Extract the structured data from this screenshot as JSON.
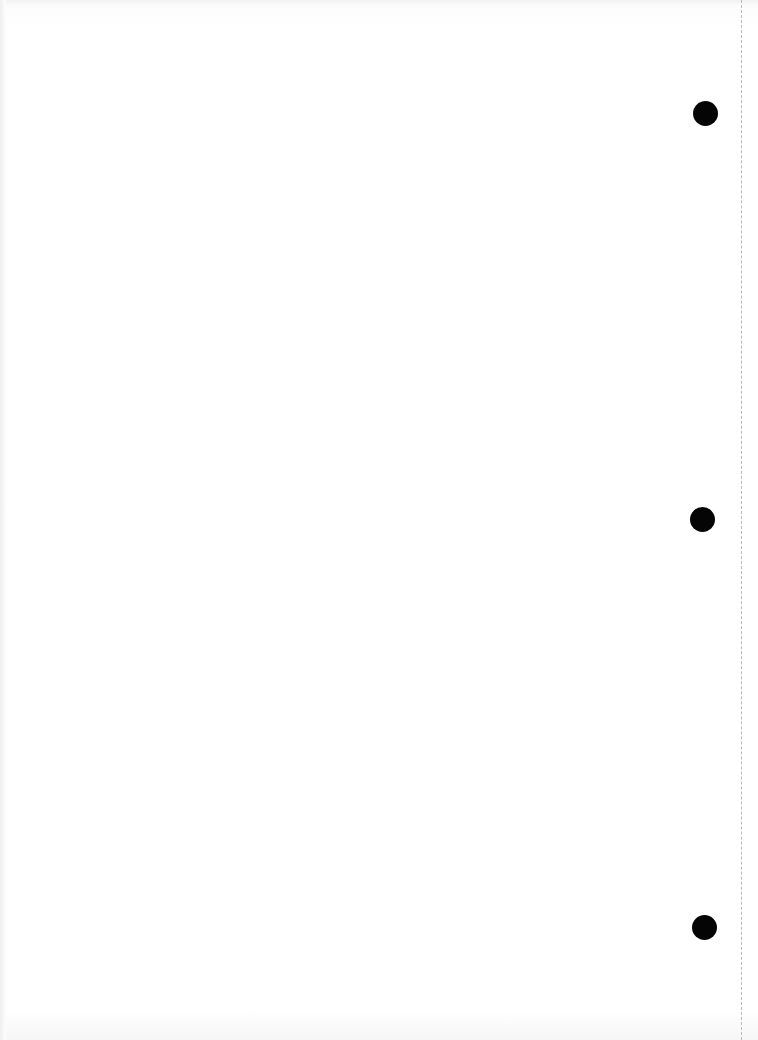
{
  "document": {
    "type": "blank-page",
    "text": "",
    "punch_holes": [
      {
        "cx": 705,
        "cy": 113
      },
      {
        "cx": 702,
        "cy": 519
      },
      {
        "cx": 704,
        "cy": 927
      }
    ],
    "perforation_x": 741,
    "colors": {
      "paper": "#ffffff",
      "hole": "#050505",
      "perforation": "#b8b8b8"
    }
  }
}
